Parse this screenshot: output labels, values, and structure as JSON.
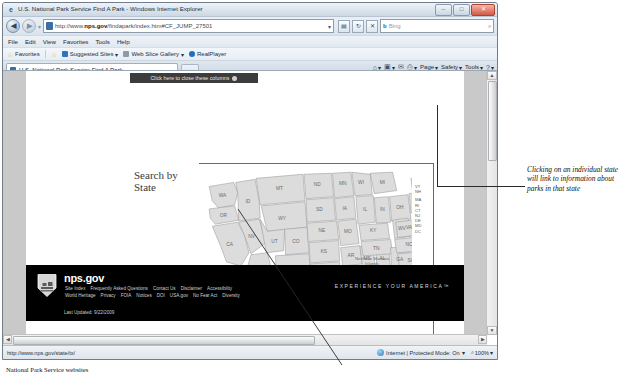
{
  "window": {
    "title": "U.S. National Park Service Find A Park - Windows Internet Explorer",
    "minimize_label": "–",
    "maximize_label": "□",
    "close_label": "✕"
  },
  "navigation": {
    "back_label": "◀",
    "forward_label": "▶",
    "recent_caret": "▾",
    "url_prefix": "http://www.",
    "url_domain": "nps.gov",
    "url_path": "/findapark/index.htm#CF_JUMP_27501",
    "url_dropdown": "▾",
    "compat_icon": "▤",
    "refresh_icon": "↻",
    "stop_icon": "✕",
    "search_engine": "b",
    "search_placeholder": "Bing",
    "search_icon": "⌕"
  },
  "menu": {
    "items": [
      "File",
      "Edit",
      "View",
      "Favorites",
      "Tools",
      "Help"
    ]
  },
  "favorites_bar": {
    "favorites_label": "Favorites",
    "items": [
      {
        "label": "Suggested Sites",
        "caret": "▾",
        "color": "#2f74c0"
      },
      {
        "label": "Web Slice Gallery",
        "caret": "▾",
        "color": "#8d9aa8"
      },
      {
        "label": "RealPlayer",
        "caret": "",
        "color": "#1f6fbf"
      }
    ]
  },
  "tabs": {
    "active": "U.S. National Park Service Find A Park",
    "new_tab_label": ""
  },
  "command_bar": {
    "items": [
      {
        "name": "home-icon",
        "glyph": "⌂",
        "caret": "▾"
      },
      {
        "name": "feeds-icon",
        "glyph": "▣",
        "caret": "▾"
      },
      {
        "name": "read-mail-icon",
        "glyph": "✉",
        "caret": ""
      },
      {
        "name": "print-icon",
        "glyph": "⎙",
        "caret": "▾"
      }
    ],
    "menus": [
      "Page",
      "Safety",
      "Tools"
    ],
    "help_glyph": "?"
  },
  "page": {
    "close_columns_banner": "Click here to close these columns",
    "close_columns_icon": "close-dot",
    "heading_line1": "Search by",
    "heading_line2": "State",
    "map": {
      "name": "us-states-map",
      "selected_state": "TX",
      "state_labels": [
        "WA",
        "OR",
        "CA",
        "NV",
        "ID",
        "MT",
        "WY",
        "UT",
        "AZ",
        "CO",
        "NM",
        "ND",
        "SD",
        "NE",
        "KS",
        "OK",
        "TX",
        "MN",
        "IA",
        "MO",
        "AR",
        "LA",
        "WI",
        "IL",
        "MS",
        "AL",
        "MI",
        "IN",
        "KY",
        "TN",
        "GA",
        "FL",
        "OH",
        "WV",
        "VA",
        "NC",
        "SC",
        "PA",
        "NY",
        "ME",
        "AK",
        "HI"
      ],
      "east_labels": [
        "VT",
        "NH",
        "MA",
        "RI",
        "CT",
        "NJ",
        "DE",
        "MD",
        "DC"
      ],
      "territories": [
        "Northern Mariana Islands",
        "American Samoa",
        "Guam",
        "Puerto Rico",
        "Virgin Islands"
      ]
    },
    "footer": {
      "site_name": "nps.gov",
      "tagline": "EXPERIENCE YOUR AMERICA",
      "tagline_mark": "™",
      "links_row1": [
        "Site Index",
        "Frequently Asked Questions",
        "Contact Us",
        "Disclaimer",
        "Accessibility"
      ],
      "links_row2": [
        "World Heritage",
        "Privacy",
        "FOIA",
        "Notices",
        "DOI",
        "USA.gov",
        "No Fear Act",
        "Diversity"
      ],
      "last_updated": "Last Updated: 9/22/2009"
    }
  },
  "scrollbars": {
    "up_arrow": "▲",
    "down_arrow": "▼",
    "left_arrow": "◀",
    "right_arrow": "▶"
  },
  "status_bar": {
    "link_url": "http://www.nps.gov/state/tx/",
    "zone": "Internet | Protected Mode: On",
    "zoom_icon": "⌕",
    "zoom_level": "100%",
    "zoom_caret": "▾",
    "zone_caret": "▾"
  },
  "annotations": {
    "right_note": "Clicking on an individual state will link to information about parks in that state",
    "bottom_caption": "National Park Service websites"
  }
}
